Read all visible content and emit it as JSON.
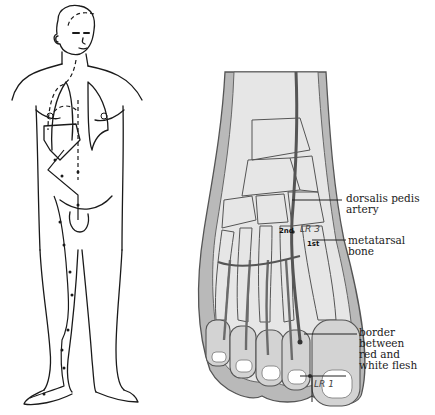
{
  "diagram": {
    "left_figure": {
      "subject": "human-body-outline",
      "meridian_path": "dashed-dotted-line"
    },
    "right_figure": {
      "subject": "foot-dorsal-view",
      "labels": {
        "artery": "dorsalis pedis\nartery",
        "bone": "metatarsal\nbone",
        "border": "border between\nred and\nwhite flesh"
      },
      "points": {
        "lr3": "LR 3",
        "lr1": "LR 1"
      },
      "metatarsal_marks": {
        "second": "2nd",
        "first": "1st"
      }
    },
    "colors": {
      "line": "#1a1a1a",
      "bone_fill": "#e6e6e6",
      "soft_tissue": "#b5b5b5",
      "artery": "#555555",
      "background": "#ffffff"
    }
  }
}
